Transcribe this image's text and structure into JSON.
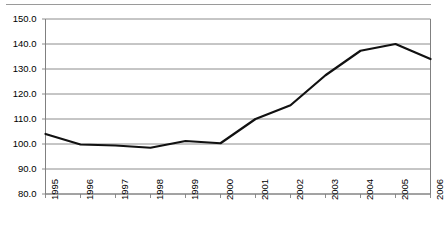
{
  "figure": {
    "top_rule": "horizontal-rule",
    "background_color": "#ffffff",
    "line_color": "#111111",
    "grid_color": "#808080",
    "axis_color": "#808080"
  },
  "chart_data": {
    "type": "line",
    "title": "",
    "subtitle": "",
    "xlabel": "",
    "ylabel": "",
    "categories": [
      "1995",
      "1996",
      "1997",
      "1998",
      "1999",
      "2000",
      "2001",
      "2002",
      "2003",
      "2004",
      "2005",
      "2006"
    ],
    "values": [
      104.0,
      99.8,
      99.4,
      98.5,
      101.2,
      100.3,
      110.0,
      115.5,
      127.5,
      137.3,
      140.0,
      134.0
    ],
    "series": [
      {
        "name": "",
        "values": [
          104.0,
          99.8,
          99.4,
          98.5,
          101.2,
          100.3,
          110.0,
          115.5,
          127.5,
          137.3,
          140.0,
          134.0
        ]
      }
    ],
    "ylim": [
      80.0,
      150.0
    ],
    "yticks": [
      80.0,
      90.0,
      100.0,
      110.0,
      120.0,
      130.0,
      140.0,
      150.0
    ],
    "ytick_labels": [
      "80.0",
      "90.0",
      "100.0",
      "110.0",
      "120.0",
      "130.0",
      "140.0",
      "150.0"
    ],
    "xtick_labels": [
      "1995",
      "1996",
      "1997",
      "1998",
      "1999",
      "2000",
      "2001",
      "2002",
      "2003",
      "2004",
      "2005",
      "2006"
    ],
    "xtick_rotation": 90,
    "grid": true,
    "grid_axis": "y",
    "legend": false,
    "legend_position": "none",
    "marker": "none",
    "line_width": 2.2,
    "annotations": []
  }
}
